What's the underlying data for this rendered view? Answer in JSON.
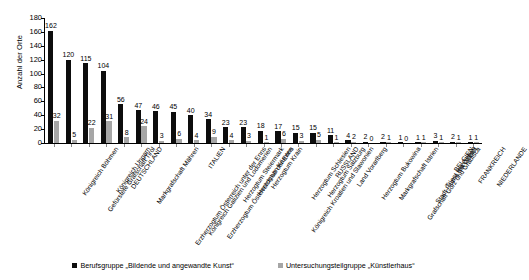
{
  "chart_data": {
    "type": "bar",
    "title": "",
    "subtitle": "",
    "xlabel": "",
    "ylabel": "Anzahl der Orte",
    "ylim": [
      0,
      180
    ],
    "ytick_step": 20,
    "yticks": [
      0,
      20,
      40,
      60,
      80,
      100,
      120,
      140,
      160,
      180
    ],
    "grid": false,
    "legend_position": "bottom",
    "orientation": "vertical",
    "grouping": "grouped",
    "colors": {
      "series_1": "#0d0d0d",
      "series_2": "#a6a6a6",
      "axis": "#000000",
      "background": "#ffffff"
    },
    "categories": [
      "Königreich Böhmen",
      "Gefürstete Grafschaft Tirol",
      "Königreich Ungarn",
      "DEUTSCHLAND",
      "Markgrafschaft Mähren",
      "Erzherzogtum Österreich unter der Enns",
      "Königreich Galizien und Lodomerien",
      "Erzherzogtum Österreich ob der Enns",
      "ITALIEN",
      "Herzogtum Steiermark",
      "Herzogtum Kärnten",
      "Herzogtum Krain",
      "Königreich Kroatien und Slawonien",
      "Herzogtum Schlesien",
      "Herzogtum Salzburg",
      "RUSSLAND",
      "Land Vorarlberg",
      "Herzogtum Bukowina",
      "Markgrafschaft Istrien",
      "Grafschaft Görz und Gradisca",
      "Stadt Fiume mit Gebiet",
      "Triest mit Gebiet",
      "BELGIEN",
      "FRANKREICH",
      "NIEDERLANDE"
    ],
    "series": [
      {
        "name": "Berufsgruppe „Bildende und angewandte Kunst“",
        "color": "#0d0d0d",
        "values": [
          162,
          120,
          115,
          104,
          56,
          47,
          46,
          45,
          40,
          34,
          23,
          23,
          18,
          17,
          15,
          15,
          11,
          4,
          2,
          2,
          1,
          1,
          3,
          2,
          1
        ]
      },
      {
        "name": "Untersuchungsteilgruppe „Künstlerhaus“",
        "color": "#a6a6a6",
        "values": [
          32,
          5,
          22,
          31,
          8,
          24,
          3,
          6,
          4,
          9,
          4,
          3,
          1,
          6,
          3,
          5,
          1,
          2,
          0,
          1,
          0,
          1,
          1,
          1,
          1
        ]
      }
    ]
  },
  "legend": {
    "items": [
      {
        "label": "Berufsgruppe „Bildende und angewandte Kunst“",
        "color": "#0d0d0d"
      },
      {
        "label": "Untersuchungsteilgruppe „Künstlerhaus“",
        "color": "#a6a6a6"
      }
    ]
  }
}
